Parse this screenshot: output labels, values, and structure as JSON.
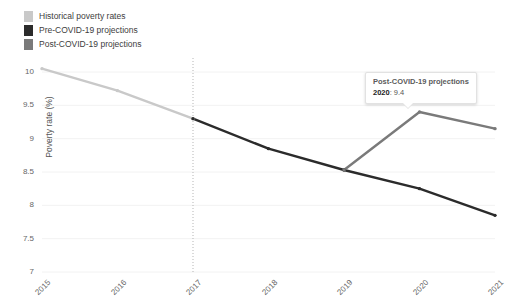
{
  "legend": {
    "position": "top-left",
    "items": [
      {
        "label": "Historical poverty rates",
        "color": "#c9c9c9",
        "series": "historical"
      },
      {
        "label": "Pre-COVID-19 projections",
        "color": "#2b2b2b",
        "series": "pre_covid"
      },
      {
        "label": "Post-COVID-19 projections",
        "color": "#7a7a7a",
        "series": "post_covid"
      }
    ]
  },
  "tooltip": {
    "title": "Post-COVID-19 projections",
    "row_label": "2020",
    "row_separator": ": ",
    "row_value": "9.4"
  },
  "chart_data": {
    "type": "line",
    "title": "",
    "xlabel": "",
    "ylabel": "Poverty rate (%)",
    "x": [
      "2015",
      "2016",
      "2017",
      "2018",
      "2019",
      "2020",
      "2021"
    ],
    "xtick_labels": [
      "2015",
      "2016",
      "2017",
      "2018",
      "2019",
      "2020",
      "2021"
    ],
    "ytick_labels": [
      "10",
      "9.5",
      "9",
      "8.5",
      "8",
      "7.5",
      "7"
    ],
    "ytick_values": [
      10,
      9.5,
      9,
      8.5,
      8,
      7.5,
      7
    ],
    "ylim": [
      7,
      10.2
    ],
    "grid": true,
    "legend_position": "top-left",
    "annotations": [
      {
        "type": "vline",
        "x": "2017",
        "style": "dotted",
        "color": "#b5b5b5",
        "label": ""
      }
    ],
    "series": [
      {
        "name": "Historical poverty rates",
        "color": "#c9c9c9",
        "x": [
          "2015",
          "2016",
          "2017"
        ],
        "values": [
          10.05,
          9.72,
          9.3
        ]
      },
      {
        "name": "Pre-COVID-19 projections",
        "color": "#2b2b2b",
        "x": [
          "2017",
          "2018",
          "2019",
          "2020",
          "2021"
        ],
        "values": [
          9.3,
          8.85,
          8.53,
          8.25,
          7.85
        ]
      },
      {
        "name": "Post-COVID-19 projections",
        "color": "#7a7a7a",
        "x": [
          "2019",
          "2020",
          "2021"
        ],
        "values": [
          8.53,
          9.4,
          9.15
        ]
      }
    ]
  }
}
